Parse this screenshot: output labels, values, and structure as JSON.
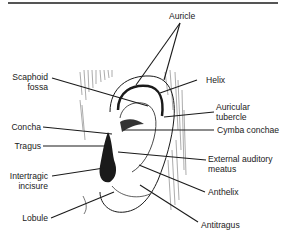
{
  "diagram": {
    "title": "",
    "labels": {
      "auricle": "Auricle",
      "scaphoid_fossa_1": "Scaphoid",
      "scaphoid_fossa_2": "fossa",
      "helix": "Helix",
      "auricular_tubercle_1": "Auricular",
      "auricular_tubercle_2": "tubercle",
      "concha": "Concha",
      "cymba_conchae": "Cymba conchae",
      "tragus": "Tragus",
      "external_auditory_meatus_1": "External auditory",
      "external_auditory_meatus_2": "meatus",
      "intertragic_incisure_1": "Intertragic",
      "intertragic_incisure_2": "incisure",
      "anthelix": "Anthelix",
      "lobule": "Lobule",
      "antitragus": "Antitragus"
    },
    "colors": {
      "ink": "#1a1a1a",
      "hatch": "#6b6b6b",
      "rule": "#555555"
    }
  }
}
